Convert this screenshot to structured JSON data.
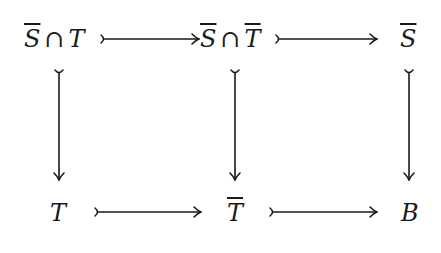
{
  "diagram": {
    "type": "commutative-diagram",
    "nodes": {
      "top_left": {
        "parts": [
          {
            "text": "S",
            "overline": true
          },
          {
            "text": "∩",
            "op": true
          },
          {
            "text": "T",
            "overline": false
          }
        ]
      },
      "top_middle": {
        "parts": [
          {
            "text": "S",
            "overline": true
          },
          {
            "text": "∩",
            "op": true
          },
          {
            "text": "T",
            "overline": true
          }
        ]
      },
      "top_right": {
        "parts": [
          {
            "text": "S",
            "overline": true
          }
        ]
      },
      "bottom_left": {
        "parts": [
          {
            "text": "T",
            "overline": false
          }
        ]
      },
      "bottom_middle": {
        "parts": [
          {
            "text": "T",
            "overline": true
          }
        ]
      },
      "bottom_right": {
        "parts": [
          {
            "text": "B",
            "overline": false
          }
        ]
      }
    },
    "arrows": [
      {
        "from": "top_left",
        "to": "top_middle",
        "style": "monomorphism"
      },
      {
        "from": "top_middle",
        "to": "top_right",
        "style": "monomorphism"
      },
      {
        "from": "bottom_left",
        "to": "bottom_middle",
        "style": "monomorphism"
      },
      {
        "from": "bottom_middle",
        "to": "bottom_right",
        "style": "monomorphism"
      },
      {
        "from": "top_left",
        "to": "bottom_left",
        "style": "monomorphism"
      },
      {
        "from": "top_middle",
        "to": "bottom_middle",
        "style": "monomorphism"
      },
      {
        "from": "top_right",
        "to": "bottom_right",
        "style": "monomorphism"
      }
    ],
    "stroke_color": "#1a1a1a"
  }
}
